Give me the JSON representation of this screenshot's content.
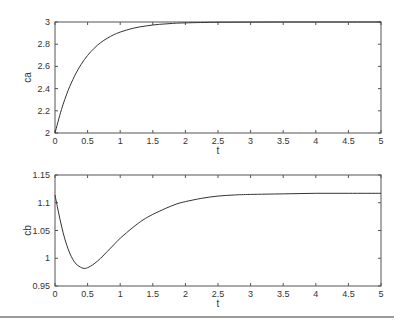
{
  "chart_data": [
    {
      "type": "line",
      "title": "",
      "xlabel": "t",
      "ylabel": "ca",
      "xlim": [
        0,
        5
      ],
      "ylim": [
        2,
        3
      ],
      "xticks": [
        "0",
        "0.5",
        "1",
        "1.5",
        "2",
        "2.5",
        "3",
        "3.5",
        "4",
        "4.5",
        "5"
      ],
      "yticks": [
        "2",
        "2.2",
        "2.4",
        "2.6",
        "2.8",
        "3"
      ],
      "grid": false,
      "legend": null,
      "series": [
        {
          "name": "ca",
          "x": [
            0,
            0.1,
            0.2,
            0.3,
            0.4,
            0.5,
            0.6,
            0.7,
            0.8,
            0.9,
            1.0,
            1.2,
            1.4,
            1.6,
            1.8,
            2.0,
            2.5,
            3.0,
            3.5,
            4.0,
            4.5,
            5.0
          ],
          "y": [
            2.0,
            2.213,
            2.381,
            2.513,
            2.617,
            2.699,
            2.763,
            2.814,
            2.853,
            2.885,
            2.909,
            2.944,
            2.965,
            2.979,
            2.987,
            2.992,
            2.998,
            2.999,
            3.0,
            3.0,
            3.0,
            3.0
          ]
        }
      ]
    },
    {
      "type": "line",
      "title": "",
      "xlabel": "t",
      "ylabel": "cb",
      "xlim": [
        0,
        5
      ],
      "ylim": [
        0.95,
        1.15
      ],
      "xticks": [
        "0",
        "0.5",
        "1",
        "1.5",
        "2",
        "2.5",
        "3",
        "3.5",
        "4",
        "4.5",
        "5"
      ],
      "yticks": [
        "0.95",
        "1",
        "1.05",
        "1.1",
        "1.15"
      ],
      "grid": false,
      "legend": null,
      "series": [
        {
          "name": "cb",
          "x": [
            0,
            0.05,
            0.1,
            0.15,
            0.2,
            0.25,
            0.3,
            0.35,
            0.43,
            0.5,
            0.6,
            0.7,
            0.8,
            0.9,
            1.0,
            1.2,
            1.35,
            1.5,
            1.7,
            1.87,
            2.0,
            2.25,
            2.5,
            2.75,
            3.0,
            3.5,
            4.0,
            4.5,
            5.0
          ],
          "y": [
            1.114,
            1.085,
            1.058,
            1.035,
            1.017,
            1.003,
            0.993,
            0.987,
            0.982,
            0.983,
            0.99,
            1.0,
            1.012,
            1.024,
            1.036,
            1.056,
            1.069,
            1.079,
            1.09,
            1.098,
            1.102,
            1.108,
            1.112,
            1.114,
            1.115,
            1.116,
            1.117,
            1.117,
            1.117
          ]
        }
      ]
    }
  ],
  "plots": {
    "top": {
      "ylabel": "ca",
      "xlabel": "t"
    },
    "bottom": {
      "ylabel": "cb",
      "xlabel": "t"
    }
  }
}
